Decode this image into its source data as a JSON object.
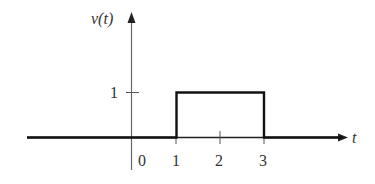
{
  "diagram": {
    "y_axis_label": "v(t)",
    "x_axis_label": "t",
    "y_ticks": [
      {
        "value": 1,
        "label": "1"
      }
    ],
    "x_ticks": [
      {
        "value": 0,
        "label": "0"
      },
      {
        "value": 1,
        "label": "1"
      },
      {
        "value": 2,
        "label": "2"
      },
      {
        "value": 3,
        "label": "3"
      }
    ],
    "signal": {
      "type": "rectangular-pulse",
      "amplitude": 1,
      "start": 1,
      "end": 3,
      "points": [
        [
          -3.5,
          0
        ],
        [
          1,
          0
        ],
        [
          1,
          1
        ],
        [
          3,
          1
        ],
        [
          3,
          0
        ],
        [
          6.2,
          0
        ]
      ]
    },
    "colors": {
      "line": "#111111",
      "axis": "#555555",
      "text": "#333333"
    }
  }
}
